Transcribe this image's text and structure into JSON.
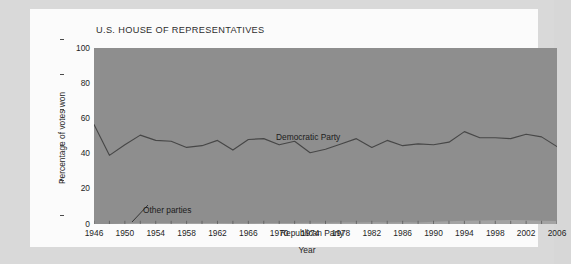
{
  "figure": {
    "title": "U.S. HOUSE OF REPRESENTATIVES",
    "x_axis_title": "Year",
    "y_axis_title": "Percentage of votes won",
    "label_democratic": "Democratic Party",
    "label_republican": "Republican Party",
    "label_other": "Other parties",
    "colors": {
      "page_background": "#d9d9d9",
      "card_background": "#fbfbfb",
      "plot_fill": "#8e8e8e",
      "other_parties_fill": "#a5a5a5",
      "line": "#4a4a4a",
      "text": "#1f1f1f"
    }
  },
  "chart_data": {
    "type": "area",
    "title": "U.S. HOUSE OF REPRESENTATIVES",
    "xlabel": "Year",
    "ylabel": "Percentage of votes won",
    "xlim": [
      1946,
      2006
    ],
    "ylim": [
      0,
      100
    ],
    "grid": false,
    "legend": "in-plot annotations",
    "y_ticks": [
      0,
      20,
      40,
      60,
      80,
      100
    ],
    "x_ticks": [
      1946,
      1950,
      1954,
      1958,
      1962,
      1966,
      1970,
      1974,
      1978,
      1982,
      1986,
      1990,
      1994,
      1998,
      2002,
      2006
    ],
    "x_minor_tick_step": 2,
    "x": [
      1946,
      1948,
      1950,
      1952,
      1954,
      1956,
      1958,
      1960,
      1962,
      1964,
      1966,
      1968,
      1970,
      1972,
      1974,
      1976,
      1978,
      1980,
      1982,
      1984,
      1986,
      1988,
      1990,
      1992,
      1994,
      1996,
      1998,
      2000,
      2002,
      2004,
      2006
    ],
    "series": [
      {
        "name": "Republican Party",
        "note": "Lower band: share of votes won by Republicans. Democratic Party occupies the region above this boundary line up to 100%.",
        "values": [
          56.5,
          39.0,
          45.0,
          50.5,
          47.5,
          47.0,
          43.5,
          44.5,
          47.5,
          42.0,
          48.0,
          48.5,
          45.0,
          47.0,
          40.5,
          42.5,
          45.5,
          48.5,
          43.5,
          47.5,
          44.5,
          45.5,
          45.0,
          46.5,
          52.5,
          49.0,
          49.0,
          48.5,
          51.0,
          49.5,
          44.0
        ]
      },
      {
        "name": "Other parties",
        "note": "Very thin band along the bottom of the plot; near zero for most years, rising slightly after 1990.",
        "values": [
          0.0,
          0.0,
          0.3,
          0.6,
          0.5,
          0.5,
          0.5,
          0.5,
          0.5,
          0.4,
          0.4,
          0.5,
          0.6,
          0.6,
          0.7,
          0.7,
          0.8,
          0.9,
          1.0,
          0.8,
          1.0,
          0.8,
          1.3,
          1.6,
          1.8,
          2.0,
          2.2,
          2.3,
          2.1,
          1.8,
          1.7
        ]
      },
      {
        "name": "Democratic Party",
        "note": "Remainder of 100% above the Republican boundary line.",
        "values": [
          43.5,
          61.0,
          55.0,
          49.5,
          52.5,
          53.0,
          56.5,
          55.5,
          52.5,
          58.0,
          52.0,
          51.5,
          55.0,
          53.0,
          59.5,
          57.5,
          54.5,
          51.5,
          56.5,
          52.5,
          55.5,
          54.5,
          55.0,
          53.5,
          47.5,
          51.0,
          51.0,
          51.5,
          49.0,
          50.5,
          56.0
        ]
      }
    ]
  }
}
